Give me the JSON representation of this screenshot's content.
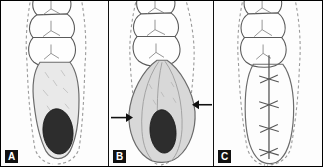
{
  "figure": {
    "type": "three-panel-surgical-diagram",
    "background_color": "#fdfdfd",
    "border_color": "#000000",
    "panel_count": 3
  },
  "palette": {
    "outline": "#6b6b6b",
    "tooth_outline": "#5a5a5a",
    "dashed_margin": "#9a9a9a",
    "lesion_fill": "#e9e9e9",
    "lesion_fill_b": "#d8d8d8",
    "dark_core": "#2d2d2d",
    "suture_line": "#555555",
    "arrow_color": "#111111",
    "label_bg": "#111111",
    "label_fg": "#ffffff"
  },
  "panels": [
    {
      "id": "panel-a",
      "label": "A",
      "caption_text": "A",
      "teeth_count": 3,
      "lesion": {
        "shape": "elongated-irregular",
        "fill": "#e9e9e9",
        "dark_core": true,
        "core_position": "lower",
        "core_fill": "#2d2d2d"
      },
      "dashed_margin": true,
      "arrows": [],
      "sutures": 0
    },
    {
      "id": "panel-b",
      "label": "B",
      "caption_text": "B",
      "teeth_count": 3,
      "lesion": {
        "shape": "expanded-fusiform",
        "fill": "#d8d8d8",
        "dark_core": true,
        "core_position": "lower",
        "core_fill": "#2d2d2d"
      },
      "dashed_margin": true,
      "arrows": [
        {
          "name": "arrow-left",
          "direction": "right",
          "x": 12,
          "y": 118
        },
        {
          "name": "arrow-right",
          "direction": "left",
          "x": 78,
          "y": 105
        }
      ],
      "sutures": 0
    },
    {
      "id": "panel-c",
      "label": "C",
      "caption_text": "C",
      "teeth_count": 3,
      "lesion": {
        "shape": "closed-oval",
        "fill": "none",
        "dark_core": false,
        "core_position": "none",
        "core_fill": "none"
      },
      "dashed_margin": true,
      "arrows": [],
      "sutures": 4,
      "incision_line": true
    }
  ]
}
